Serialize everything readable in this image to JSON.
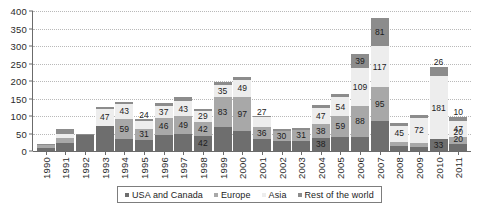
{
  "chart_data": {
    "type": "bar",
    "stacked": true,
    "title": "",
    "subtitle": "",
    "xlabel": "",
    "ylabel": "",
    "ylim": [
      0,
      400
    ],
    "yticks": [
      0,
      50,
      100,
      150,
      200,
      250,
      300,
      350,
      400
    ],
    "grid": true,
    "legend_position": "bottom",
    "categories": [
      "1990",
      "1991",
      "1992",
      "1993",
      "1994",
      "1995",
      "1996",
      "1997",
      "1998",
      "1999",
      "2000",
      "2001",
      "2002",
      "2003",
      "2004",
      "2005",
      "2006",
      "2007",
      "2008",
      "2009",
      "2010",
      "2011"
    ],
    "series": [
      {
        "name": "USA and Canada",
        "color": "#6e6e6e",
        "values": [
          10,
          22,
          45,
          72,
          33,
          32,
          47,
          50,
          42,
          70,
          57,
          33,
          28,
          30,
          38,
          40,
          40,
          87,
          15,
          12,
          33,
          20
        ]
      },
      {
        "name": "Europe",
        "color": "#a8a8a8",
        "values": [
          6,
          14,
          0,
          0,
          59,
          31,
          46,
          49,
          42,
          83,
          97,
          36,
          30,
          31,
          38,
          59,
          88,
          95,
          12,
          10,
          0,
          20
        ]
      },
      {
        "name": "Asia",
        "color": "#ededed",
        "values": [
          0,
          12,
          0,
          47,
          43,
          24,
          37,
          43,
          29,
          35,
          49,
          27,
          0,
          0,
          47,
          54,
          109,
          117,
          45,
          72,
          181,
          47
        ]
      },
      {
        "name": "Rest of the world",
        "color": "#8c8c8c",
        "values": [
          5,
          14,
          5,
          8,
          6,
          5,
          6,
          12,
          7,
          8,
          8,
          5,
          5,
          5,
          8,
          10,
          39,
          81,
          8,
          10,
          26,
          10
        ]
      }
    ],
    "data_labels": [
      {
        "year": "1990",
        "labels": []
      },
      {
        "year": "1991",
        "labels": []
      },
      {
        "year": "1992",
        "labels": []
      },
      {
        "year": "1993",
        "labels": [
          "47"
        ]
      },
      {
        "year": "1994",
        "labels": [
          "59",
          "43"
        ]
      },
      {
        "year": "1995",
        "labels": [
          "31",
          "24"
        ]
      },
      {
        "year": "1996",
        "labels": [
          "46",
          "37"
        ]
      },
      {
        "year": "1997",
        "labels": [
          "49",
          "43"
        ]
      },
      {
        "year": "1998",
        "labels": [
          "42",
          "29"
        ]
      },
      {
        "year": "1999",
        "labels": [
          "83",
          "35"
        ]
      },
      {
        "year": "2000",
        "labels": [
          "97",
          "49"
        ]
      },
      {
        "year": "2001",
        "labels": [
          "36",
          "27"
        ]
      },
      {
        "year": "2002",
        "labels": [
          "30"
        ]
      },
      {
        "year": "2003",
        "labels": [
          "31"
        ]
      },
      {
        "year": "2004",
        "labels": [
          "38",
          "47"
        ]
      },
      {
        "year": "2005",
        "labels": [
          "59",
          "54",
          "24"
        ]
      },
      {
        "year": "2006",
        "labels": [
          "88",
          "109",
          "39"
        ]
      },
      {
        "year": "2007",
        "labels": [
          "95",
          "117",
          "81"
        ]
      },
      {
        "year": "2008",
        "labels": [
          "45"
        ]
      },
      {
        "year": "2009",
        "labels": [
          "72"
        ]
      },
      {
        "year": "2010",
        "labels": [
          "33",
          "181",
          "26"
        ]
      },
      {
        "year": "2011",
        "labels": [
          "20",
          "47",
          "10"
        ]
      }
    ]
  },
  "axes": {
    "y_ticks": [
      "400",
      "350",
      "300",
      "250",
      "200",
      "150",
      "100",
      "50",
      "0"
    ],
    "x_labels": [
      "1990",
      "1991",
      "1992",
      "1993",
      "1994",
      "1995",
      "1996",
      "1997",
      "1998",
      "1999",
      "2000",
      "2001",
      "2002",
      "2003",
      "2004",
      "2005",
      "2006",
      "2007",
      "2008",
      "2009",
      "2010",
      "2011"
    ]
  },
  "legend": {
    "items": [
      {
        "label": "USA and Canada",
        "color": "#6e6e6e"
      },
      {
        "label": "Europe",
        "color": "#a8a8a8"
      },
      {
        "label": "Asia",
        "color": "#ededed"
      },
      {
        "label": "Rest of the world",
        "color": "#8c8c8c"
      }
    ]
  },
  "colors": {
    "usa_and_canada": "#6e6e6e",
    "europe": "#a8a8a8",
    "asia": "#ededed",
    "rest_of_the_world": "#8c8c8c",
    "grid": "#b9b9b9",
    "axis": "#6b6b6b",
    "text": "#1c1c1c",
    "background": "#ffffff"
  }
}
